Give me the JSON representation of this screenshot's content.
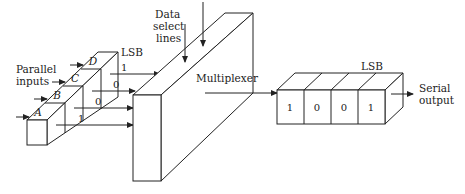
{
  "diagram": {
    "parallel_register": {
      "label": "Parallel inputs",
      "label_line1": "Parallel",
      "label_line2": "inputs",
      "lsb_label": "LSB",
      "cells": [
        "A",
        "B",
        "C",
        "D"
      ],
      "output_bits": [
        "1",
        "0",
        "0",
        "1"
      ]
    },
    "multiplexer": {
      "label": "Multiplexer",
      "select_label_line1": "Data",
      "select_label_line2": "select",
      "select_label_line3": "lines"
    },
    "shift_register": {
      "lsb_label": "LSB",
      "bits": [
        "1",
        "0",
        "0",
        "1"
      ],
      "output_label_line1": "Serial",
      "output_label_line2": "output"
    },
    "colors": {
      "line": "#222222",
      "background": "#ffffff"
    }
  }
}
